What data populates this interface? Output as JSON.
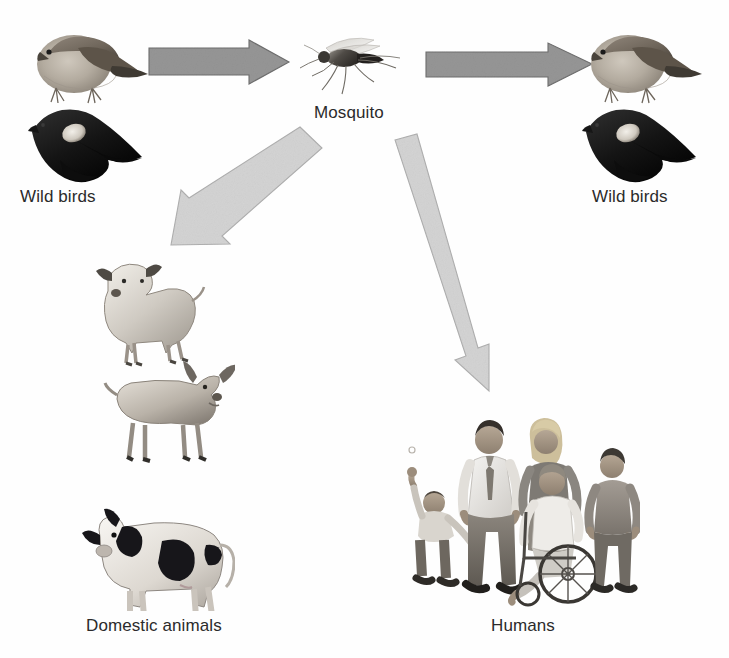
{
  "diagram": {
    "type": "flow-diagram",
    "background_color": "#fefefe",
    "text_color": "#2b2b2b",
    "arrow_colors": {
      "horizontal": "#969696",
      "horizontal_outline": "#7d7d7d",
      "diagonal": "#d2d2d2",
      "diagonal_outline": "#b3b3b3"
    },
    "nodes": [
      {
        "id": "wild-birds-left",
        "label": "Wild birds",
        "icon": "wild-birds-pair-illustration",
        "description": "photo of a grey-brown sparrow above a black red-winged blackbird"
      },
      {
        "id": "mosquito",
        "label": "Mosquito",
        "icon": "mosquito-illustration",
        "description": "photo of a mosquito in side profile"
      },
      {
        "id": "wild-birds-right",
        "label": "Wild birds",
        "icon": "wild-birds-pair-illustration",
        "description": "photo of a grey-brown sparrow above a black red-winged blackbird"
      },
      {
        "id": "domestic-animals",
        "label": "Domestic animals",
        "icon": "domestic-animals-illustration",
        "description": "illustrations of a sheep, a goat and a black-and-white cow"
      },
      {
        "id": "humans",
        "label": "Humans",
        "icon": "humans-group-illustration",
        "description": "illustration of a family: boy with raised arm, man in shirt and tie, woman, person in wheelchair, teenage boy"
      }
    ],
    "arrows": [
      {
        "id": "arrow-birds-to-mosquito",
        "from": "wild-birds-left",
        "to": "mosquito",
        "style": "horizontal-right",
        "tone": "dark"
      },
      {
        "id": "arrow-mosquito-to-birds",
        "from": "mosquito",
        "to": "wild-birds-right",
        "style": "horizontal-right",
        "tone": "dark"
      },
      {
        "id": "arrow-mosquito-to-animals",
        "from": "mosquito",
        "to": "domestic-animals",
        "style": "diagonal-down-left",
        "tone": "light"
      },
      {
        "id": "arrow-mosquito-to-humans",
        "from": "mosquito",
        "to": "humans",
        "style": "diagonal-down-right",
        "tone": "light"
      }
    ]
  }
}
